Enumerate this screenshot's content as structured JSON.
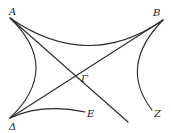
{
  "diagram": {
    "type": "geometric-figure",
    "colors": {
      "stroke": "#2a2a2a",
      "label": "#222222",
      "background": "#ffffff"
    },
    "points": [
      {
        "id": "A",
        "label": "A",
        "x": 10,
        "y": 18
      },
      {
        "id": "B",
        "label": "B",
        "x": 163,
        "y": 20
      },
      {
        "id": "G",
        "label": "Γ",
        "x": 86,
        "y": 86
      },
      {
        "id": "D",
        "label": "Δ",
        "x": 10,
        "y": 118
      },
      {
        "id": "E",
        "label": "E",
        "x": 85,
        "y": 112
      },
      {
        "id": "Z",
        "label": "Z",
        "x": 152,
        "y": 110
      }
    ],
    "labels": {
      "A": "A",
      "B": "B",
      "G": "Γ",
      "D": "Δ",
      "E": "E",
      "Z": "Z"
    },
    "edges": [
      {
        "from": "A",
        "to": "B",
        "kind": "curve",
        "description": "concave arc between A and B"
      },
      {
        "from": "A",
        "to": "D",
        "kind": "curve",
        "description": "arc bulging toward interior"
      },
      {
        "from": "B",
        "to": "Z",
        "kind": "curve",
        "description": "arc bulging toward interior"
      },
      {
        "from": "D",
        "to": "E",
        "kind": "curve",
        "description": "shallow arc"
      },
      {
        "from": "A",
        "to": "G",
        "kind": "line",
        "description": "straight line through Γ extended"
      },
      {
        "from": "D",
        "to": "B",
        "kind": "line",
        "description": "straight line through Γ"
      }
    ]
  }
}
